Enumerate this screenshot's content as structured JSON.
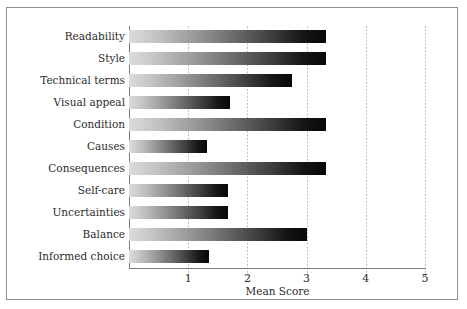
{
  "chart_data": {
    "type": "bar",
    "orientation": "horizontal",
    "title": "",
    "xlabel": "Mean Score",
    "ylabel": "",
    "xlim": [
      0,
      5
    ],
    "ylim": null,
    "grid": true,
    "grid_axis": "x",
    "legend": false,
    "xticks": [
      "1",
      "2",
      "3",
      "4",
      "5"
    ],
    "xtick_values": [
      1,
      2,
      3,
      4,
      5
    ],
    "categories": [
      "Readability",
      "Style",
      "Technical terms",
      "Visual appeal",
      "Condition",
      "Causes",
      "Consequences",
      "Self-care",
      "Uncertainties",
      "Balance",
      "Informed choice"
    ],
    "values": [
      3.33,
      3.33,
      2.75,
      1.7,
      3.33,
      1.32,
      3.33,
      1.68,
      1.68,
      3.0,
      1.35
    ],
    "bar_style": "grayscale-gradient",
    "colors": {
      "bar_gradient_start": "#dcdcdc",
      "bar_gradient_end": "#070707",
      "gridline": "#b9b9b9",
      "axis_line": "#7a7a7a",
      "frame": "#8d8d8d",
      "text": "#2b2b2b",
      "background": "#ffffff"
    }
  }
}
